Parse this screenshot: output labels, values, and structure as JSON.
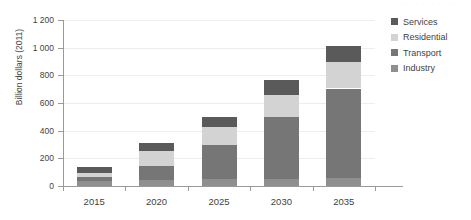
{
  "top_remnant_text": "· · · · · · · · · · · · · ·",
  "chart_data": {
    "type": "bar",
    "stacked": true,
    "title": "",
    "subtitle": "",
    "xlabel": "",
    "ylabel": "Billion dollars (2011)",
    "categories": [
      "2015",
      "2020",
      "2025",
      "2030",
      "2035"
    ],
    "series": [
      {
        "name": "Industry",
        "color": "#8f8f8f",
        "values": [
          35,
          40,
          48,
          52,
          55
        ]
      },
      {
        "name": "Transport",
        "color": "#767676",
        "values": [
          30,
          105,
          245,
          446,
          650
        ]
      },
      {
        "name": "Residential",
        "color": "#d3d3d3",
        "values": [
          32,
          105,
          137,
          160,
          190
        ]
      },
      {
        "name": "Services",
        "color": "#5a5a5a",
        "values": [
          43,
          60,
          72,
          107,
          120
        ]
      }
    ],
    "stack_order": [
      "Industry",
      "Transport",
      "Residential",
      "Services"
    ],
    "cumulative_totals": {
      "2015": {
        "Industry": 35,
        "Transport": 65,
        "Residential": 97,
        "Services": 140
      },
      "2020": {
        "Industry": 40,
        "Transport": 145,
        "Residential": 250,
        "Services": 310
      },
      "2025": {
        "Industry": 48,
        "Transport": 293,
        "Residential": 430,
        "Services": 502
      },
      "2030": {
        "Industry": 52,
        "Transport": 498,
        "Residential": 658,
        "Services": 765
      },
      "2035": {
        "Industry": 55,
        "Transport": 705,
        "Residential": 895,
        "Services": 1015
      }
    },
    "totals": [
      140,
      310,
      502,
      765,
      1015
    ],
    "ylim": [
      0,
      1200
    ],
    "yticks": [
      0,
      200,
      400,
      600,
      800,
      1000,
      1200
    ],
    "ytick_labels": [
      "0",
      "200",
      "400",
      "600",
      "800",
      "1 000",
      "1 200"
    ],
    "grid": true,
    "legend_position": "right",
    "legend_entries": [
      "Services",
      "Residential",
      "Transport",
      "Industry"
    ]
  },
  "legend": {
    "items": [
      {
        "label": "Services",
        "color": "#5a5a5a"
      },
      {
        "label": "Residential",
        "color": "#d3d3d3"
      },
      {
        "label": "Transport",
        "color": "#767676"
      },
      {
        "label": "Industry",
        "color": "#8f8f8f"
      }
    ]
  },
  "axes": {
    "y_title": "Billion dollars (2011)",
    "y_tick_labels": [
      "1 200",
      "1 000",
      "800",
      "600",
      "400",
      "200",
      "0"
    ],
    "x_tick_labels": [
      "2015",
      "2020",
      "2025",
      "2030",
      "2035"
    ]
  },
  "colors": {
    "grid": "#ededed",
    "axis": "#9a9a9a",
    "text": "#3f3f3f",
    "background": "#ffffff"
  }
}
